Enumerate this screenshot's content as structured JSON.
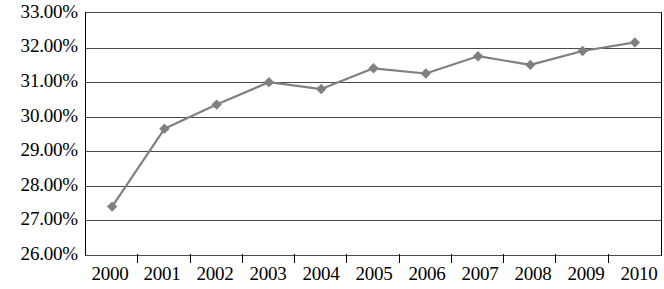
{
  "chart_data": {
    "type": "line",
    "title": "",
    "subtitle": "",
    "xlabel": "",
    "ylabel": "",
    "categories": [
      "2000",
      "2001",
      "2002",
      "2003",
      "2004",
      "2005",
      "2006",
      "2007",
      "2008",
      "2009",
      "2010"
    ],
    "values": [
      27.4,
      29.65,
      30.35,
      31.0,
      30.8,
      31.4,
      31.25,
      31.75,
      31.5,
      31.9,
      32.15
    ],
    "series": [
      {
        "name": "",
        "values": [
          27.4,
          29.65,
          30.35,
          31.0,
          30.8,
          31.4,
          31.25,
          31.75,
          31.5,
          31.9,
          32.15
        ],
        "line_color": "#808080",
        "marker_color": "#808080",
        "marker_shape": "diamond"
      }
    ],
    "ylim": [
      26.0,
      33.0
    ],
    "ytick_values": [
      33.0,
      32.0,
      31.0,
      30.0,
      29.0,
      28.0,
      27.0,
      26.0
    ],
    "ytick_labels": [
      "33.00%",
      "32.00%",
      "31.00%",
      "30.00%",
      "29.00%",
      "28.00%",
      "27.00%",
      "26.00%"
    ],
    "xtick_labels": [
      "2000",
      "2001",
      "2002",
      "2003",
      "2004",
      "2005",
      "2006",
      "2007",
      "2008",
      "2009",
      "2010"
    ],
    "grid": true,
    "grid_axis": "y",
    "legend": false,
    "legend_position": "none",
    "annotations": [],
    "value_format": "percent",
    "colors": {
      "line": "#808080",
      "marker": "#808080",
      "gridline": "#4a4a4a",
      "axis": "#000000",
      "background": "#ffffff",
      "text": "#000000"
    }
  }
}
